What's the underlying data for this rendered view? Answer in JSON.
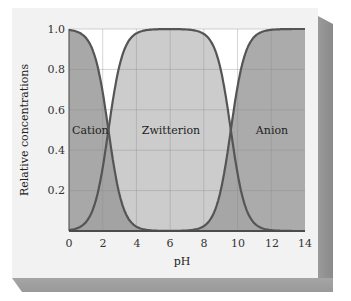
{
  "chart_data": {
    "type": "area",
    "title": "",
    "xlabel": "pH",
    "ylabel": "Relative concentrations",
    "xlim": [
      0,
      14
    ],
    "ylim": [
      0,
      1.0
    ],
    "x_ticks": [
      "0",
      "2",
      "4",
      "6",
      "8",
      "10",
      "12",
      "14"
    ],
    "y_ticks": [
      "0.2",
      "0.4",
      "0.6",
      "0.8",
      "1.0"
    ],
    "grid": true,
    "pKa": [
      2.34,
      9.6
    ],
    "series": [
      {
        "name": "Cation",
        "description": "fraction falls from 1.0 at pH 0 to 0.5 at pH≈2.3 and ~0 by pH≈4",
        "x": [
          0,
          1,
          2,
          2.34,
          3,
          4,
          5
        ],
        "values": [
          1.0,
          0.96,
          0.69,
          0.5,
          0.18,
          0.02,
          0.0
        ],
        "color": "#9e9e9e"
      },
      {
        "name": "Zwitterion",
        "description": "rises from 0 to 1.0 between pH 2 and 5, plateau 1.0 to pH≈7.5, falls to 0 by pH≈12",
        "x": [
          0,
          1,
          2,
          2.34,
          3,
          4,
          5,
          6,
          7,
          8,
          9,
          9.6,
          10,
          11,
          12
        ],
        "values": [
          0.0,
          0.04,
          0.31,
          0.5,
          0.82,
          0.98,
          1.0,
          1.0,
          1.0,
          0.97,
          0.8,
          0.5,
          0.28,
          0.04,
          0.0
        ],
        "color": "#c8c8c8"
      },
      {
        "name": "Anion",
        "description": "rises from ~0 at pH≈7.5 to 0.5 at pH≈9.6 and ~1.0 by pH≈12",
        "x": [
          7,
          8,
          9,
          9.6,
          10,
          11,
          12,
          13,
          14
        ],
        "values": [
          0.0,
          0.03,
          0.2,
          0.5,
          0.72,
          0.96,
          1.0,
          1.0,
          1.0
        ],
        "color": "#a3a3a3"
      }
    ],
    "annotations": [
      {
        "text": "Cation",
        "x": 0.9,
        "y": 0.5
      },
      {
        "text": "Zwitterion",
        "x": 6,
        "y": 0.5
      },
      {
        "text": "Anion",
        "x": 12.5,
        "y": 0.5
      }
    ]
  },
  "labels": {
    "xlabel": "pH",
    "ylabel": "Relative concentrations",
    "cation": "Cation",
    "zwitterion": "Zwitterion",
    "anion": "Anion",
    "x_ticks": [
      "0",
      "2",
      "4",
      "6",
      "8",
      "10",
      "12",
      "14"
    ],
    "y_ticks": [
      "0.2",
      "0.4",
      "0.6",
      "0.8",
      "1.0"
    ]
  },
  "colors": {
    "cation_fill": "#9e9e9e",
    "zwitterion_fill": "#c9c9c9",
    "anion_fill": "#a2a2a2",
    "curve_stroke": "#555555",
    "grid": "#888888",
    "plot_bg": "#ffffff",
    "card_bg": "#f2f2f2"
  }
}
